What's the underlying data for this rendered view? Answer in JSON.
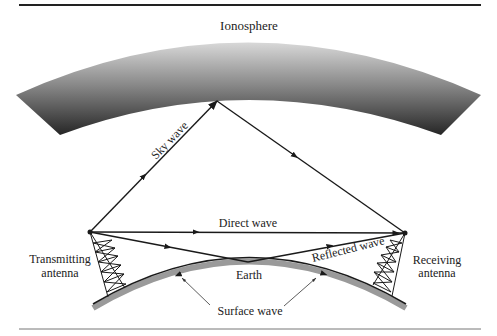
{
  "diagram": {
    "title_label": "Ionosphere",
    "labels": {
      "sky_wave": "Sky wave",
      "direct_wave": "Direct wave",
      "reflected_wave": "Reflected wave",
      "earth": "Earth",
      "surface_wave": "Surface wave",
      "transmitting_line1": "Transmitting",
      "transmitting_line2": "antenna",
      "receiving_line1": "Receiving",
      "receiving_line2": "antenna"
    },
    "colors": {
      "line": "#1a1a1a",
      "ionosphere_dark": "#2a2a2a",
      "ionosphere_light": "#d4d4d4",
      "earth_shade": "#9a9a9a",
      "rule": "#333333"
    }
  }
}
